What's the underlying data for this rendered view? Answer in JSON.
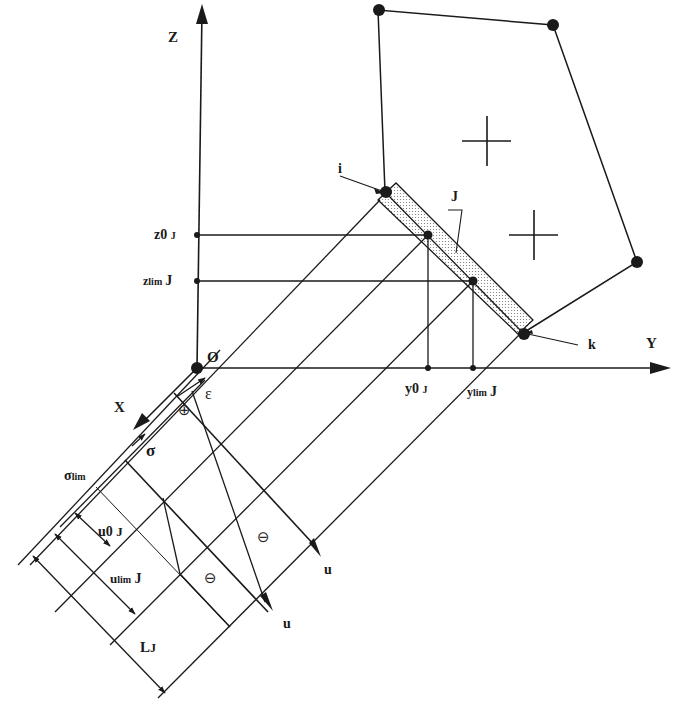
{
  "figure": {
    "axes": {
      "z_label": "Z",
      "y_label": "Y",
      "x_label": "X",
      "origin_label": "O"
    },
    "section_nodes": {
      "i_label": "i",
      "k_label": "k",
      "element_label": "J"
    },
    "z_ticks": [
      {
        "main": "z0",
        "sub": "J"
      },
      {
        "main": "z",
        "sub_lim": "lim",
        "sub": "J"
      }
    ],
    "y_ticks": [
      {
        "main": "y0",
        "sub": "J"
      },
      {
        "main": "y",
        "sub_lim": "lim",
        "sub": "J"
      }
    ],
    "diagram_labels": {
      "epsilon": "ε",
      "sigma": "σ",
      "sigma_lim": "σ",
      "sigma_lim_sub": "lim",
      "plus_sign": "⊕",
      "minus_sign_1": "⊖",
      "minus_sign_2": "⊖",
      "u_axis_1": "u",
      "u_axis_2": "u"
    },
    "dimensions": [
      {
        "main": "u0",
        "sub": "J"
      },
      {
        "main": "u",
        "sub_lim": "lim",
        "sub": "J"
      },
      {
        "main": "L",
        "sub": "J"
      }
    ],
    "colors": {
      "ink": "#1a1a1a",
      "background": "#ffffff",
      "hatch": "#8a8a8a"
    }
  }
}
